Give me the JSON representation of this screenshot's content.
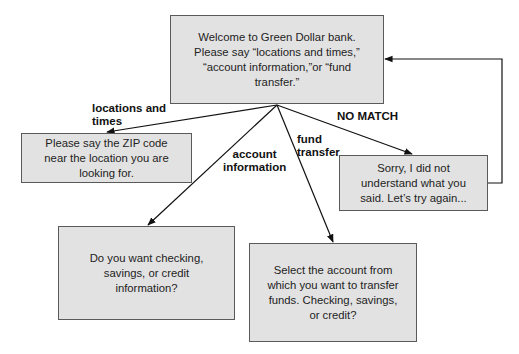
{
  "diagram": {
    "type": "flowchart",
    "nodes": {
      "welcome": {
        "text": "Welcome to Green Dollar bank.\nPlease say “locations and times,”\n“account information,”or “fund\ntransfer.”"
      },
      "zip": {
        "text": "Please say the ZIP code\nnear the location you are\nlooking for."
      },
      "nomatch": {
        "text": "Sorry, I did not\nunderstand what you\nsaid. Let’s try again..."
      },
      "account": {
        "text": "Do you want checking,\nsavings, or credit\ninformation?"
      },
      "transfer": {
        "text": "Select the account from\nwhich you want to transfer\nfunds. Checking, savings,\nor credit?"
      }
    },
    "edges": {
      "locations": {
        "from": "welcome",
        "to": "zip",
        "label": "locations and\ntimes"
      },
      "account": {
        "from": "welcome",
        "to": "account",
        "label": "account\ninformation"
      },
      "fund": {
        "from": "welcome",
        "to": "transfer",
        "label": "fund\ntransfer"
      },
      "nomatch": {
        "from": "welcome",
        "to": "nomatch",
        "label": "NO MATCH"
      },
      "retry": {
        "from": "nomatch",
        "to": "welcome",
        "label": ""
      }
    },
    "colors": {
      "box_fill": "#e2e2e2",
      "box_border": "#5a5a5a",
      "line": "#111111"
    }
  }
}
